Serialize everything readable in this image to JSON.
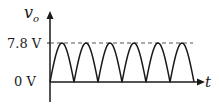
{
  "chart_data": {
    "type": "line",
    "title": "",
    "xlabel": "t",
    "ylabel": "v_o",
    "ylabel_main": "v",
    "ylabel_sub": "o",
    "yticks": [
      "0 V",
      "7.8 V"
    ],
    "peak_value": 7.8,
    "peak_label": "7.8 V",
    "zero_label": "0 V",
    "unit": "V",
    "num_half_cycles": 6,
    "reference_line": {
      "value": 7.8,
      "style": "dashed"
    },
    "series": [
      {
        "name": "v_o",
        "shape": "|sin| (full-wave rectified)",
        "min": 0,
        "max": 7.8
      }
    ],
    "ylim": [
      0,
      7.8
    ],
    "grid": false,
    "legend": null
  },
  "colors": {
    "stroke": "#1a1a1a",
    "dash": "#555555",
    "background": "#ffffff"
  }
}
